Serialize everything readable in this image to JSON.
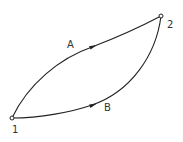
{
  "diagram": {
    "type": "process-paths",
    "points": [
      {
        "id": "1",
        "label": "1"
      },
      {
        "id": "2",
        "label": "2"
      }
    ],
    "paths": [
      {
        "id": "A",
        "label": "A",
        "from": "1",
        "to": "2",
        "shape": "upper-arc",
        "direction": "1->2"
      },
      {
        "id": "B",
        "label": "B",
        "from": "1",
        "to": "2",
        "shape": "lower-arc",
        "direction": "1->2"
      }
    ],
    "colors": {
      "stroke": "#222222",
      "text": "#333333",
      "background": "#ffffff"
    }
  }
}
